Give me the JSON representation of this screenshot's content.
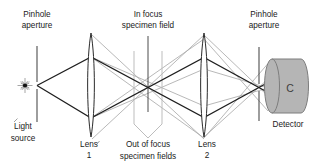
{
  "diagram": {
    "top_labels": {
      "pinhole_left_line1": "Pinhole",
      "pinhole_left_line2": "aperture",
      "in_focus_line1": "In focus",
      "in_focus_line2": "specimen field",
      "pinhole_right_line1": "Pinhole",
      "pinhole_right_line2": "aperture"
    },
    "bottom_labels": {
      "light_source_line1": "Light",
      "light_source_line2": "source",
      "lens1_line1": "Lens",
      "lens1_line2": "1",
      "out_of_focus_line1": "Out of focus",
      "out_of_focus_line2": "specimen fields",
      "lens2_line1": "Lens",
      "lens2_line2": "2",
      "detector": "Detector"
    },
    "detector_marking": "C",
    "colors": {
      "in_focus_ray": "#1f1f1f",
      "out_of_focus_ray": "#a6a6a6",
      "specimen_plane_dark": "#4d4d4d",
      "specimen_plane_gray": "#bdbdbd",
      "pinhole_line": "#4d4d4d",
      "detector_fill": "#b5b5b5",
      "detector_outline": "#7d7d7d",
      "text": "#1a1a1a",
      "background": "#ffffff"
    }
  }
}
